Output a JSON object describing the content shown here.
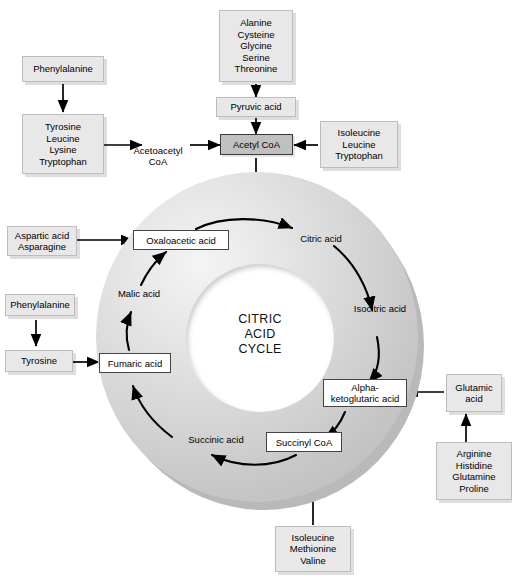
{
  "diagram": {
    "center_label_line1": "CITRIC",
    "center_label_line2": "ACID",
    "center_label_line3": "CYCLE"
  },
  "cycle_intermediates": [
    {
      "id": "oxaloacetic",
      "label": "Oxaloacetic acid",
      "style": "white"
    },
    {
      "id": "citric",
      "label": "Citric acid",
      "style": "plain"
    },
    {
      "id": "isocitric",
      "label": "Isocitric acid",
      "style": "plain"
    },
    {
      "id": "alpha_ketoglutaric",
      "label": "Alpha-ketoglutaric acid",
      "style": "white"
    },
    {
      "id": "succinyl_coa",
      "label": "Succinyl CoA",
      "style": "white"
    },
    {
      "id": "succinic",
      "label": "Succinic acid",
      "style": "plain"
    },
    {
      "id": "fumaric",
      "label": "Fumaric acid",
      "style": "white"
    },
    {
      "id": "malic",
      "label": "Malic acid",
      "style": "plain"
    }
  ],
  "entry_nodes": {
    "phenylalanine_top": "Phenylalanine",
    "tyrosine_group": "Tyrosine\nLeucine\nLysine\nTryptophan",
    "acetoacetyl_coa": "Acetoacetyl\nCoA",
    "alanine_group": "Alanine\nCysteine\nGlycine\nSerine\nThreonine",
    "pyruvic_acid": "Pyruvic acid",
    "acetyl_coa": "Acetyl CoA",
    "isoleucine_group": "Isoleucine\nLeucine\nTryptophan",
    "aspartic_group": "Aspartic acid\nAsparagine",
    "phenylalanine_left": "Phenylalanine",
    "tyrosine_left": "Tyrosine",
    "glutamic_acid": "Glutamic\nacid",
    "arginine_group": "Arginine\nHistidine\nGlutamine\nProline",
    "isoleucine_bottom": "Isoleucine\nMethionine\nValine"
  },
  "colors": {
    "source_box_fill": "#e8e8e8",
    "source_box_border": "#bdbdbd",
    "white_box_fill": "#ffffff",
    "white_box_border": "#444444",
    "acetyl_coa_fill": "#c0c0c0",
    "acetyl_coa_border": "#3a3a3a",
    "ring_light": "#f1f1f1",
    "ring_dark": "#bdbdbd",
    "arrow": "#000000",
    "background": "#ffffff"
  }
}
